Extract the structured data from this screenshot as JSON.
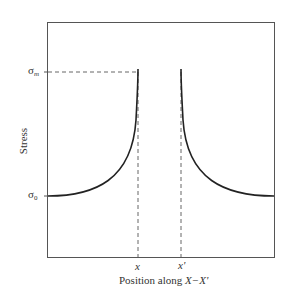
{
  "diagram": {
    "type": "stress-concentration-plot",
    "ylabel": "Stress",
    "xlabel_prefix": "Position along ",
    "xlabel_var": "X−X'",
    "y_markers": [
      {
        "symbol": "σ",
        "subscript": "m",
        "meaning": "maximum stress"
      },
      {
        "symbol": "σ",
        "subscript": "0",
        "meaning": "nominal stress"
      }
    ],
    "x_markers": [
      "x",
      "x'"
    ],
    "colors": {
      "frame": "#555555",
      "curve": "#222222",
      "dashed": "#666666"
    }
  }
}
